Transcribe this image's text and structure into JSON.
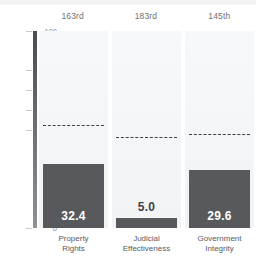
{
  "chart_data": {
    "type": "bar",
    "title": "",
    "xlabel": "",
    "ylabel": "",
    "ylim": [
      0,
      100
    ],
    "grid": false,
    "legend": "none",
    "categories": [
      "Property Rights",
      "Judicial Effectiveness",
      "Government Integrity"
    ],
    "values": [
      32.4,
      5.0,
      29.6
    ],
    "value_labels": [
      "32.4",
      "5.0",
      "29.6"
    ],
    "ranks": [
      "163rd",
      "183rd",
      "145th"
    ],
    "reference_lines": {
      "label": "world average",
      "style": "dashed",
      "values": [
        51.9,
        45.6,
        47.2
      ]
    },
    "y_ticks": [
      {
        "value": 100,
        "label": "100"
      },
      {
        "value": 80,
        "label": "80"
      },
      {
        "value": 70,
        "label": "70"
      },
      {
        "value": 60,
        "label": "60"
      },
      {
        "value": 50,
        "label": "50"
      },
      {
        "value": 0,
        "label": "0"
      }
    ],
    "colors": {
      "bar": "#58595c",
      "panel": "#f4f5f6",
      "axis": "#6a6c70",
      "dash": "#3f4044",
      "tick_text": "#8a8c90",
      "rank_text": "#6f7175",
      "category_text": "#58595c",
      "value_text_inside": "#ffffff",
      "value_text_outside": "#3f4044"
    }
  },
  "header": {
    "ranks": [
      "163rd",
      "183rd",
      "145th"
    ]
  },
  "axis": {
    "ticks": [
      "100",
      "80",
      "70",
      "60",
      "50",
      "0"
    ]
  },
  "series": {
    "bars": [
      {
        "category_line1": "Property",
        "category_line2": "Rights",
        "value_label": "32.4"
      },
      {
        "category_line1": "Judicial",
        "category_line2": "Effectiveness",
        "value_label": "5.0"
      },
      {
        "category_line1": "Government",
        "category_line2": "Integrity",
        "value_label": "29.6"
      }
    ]
  }
}
